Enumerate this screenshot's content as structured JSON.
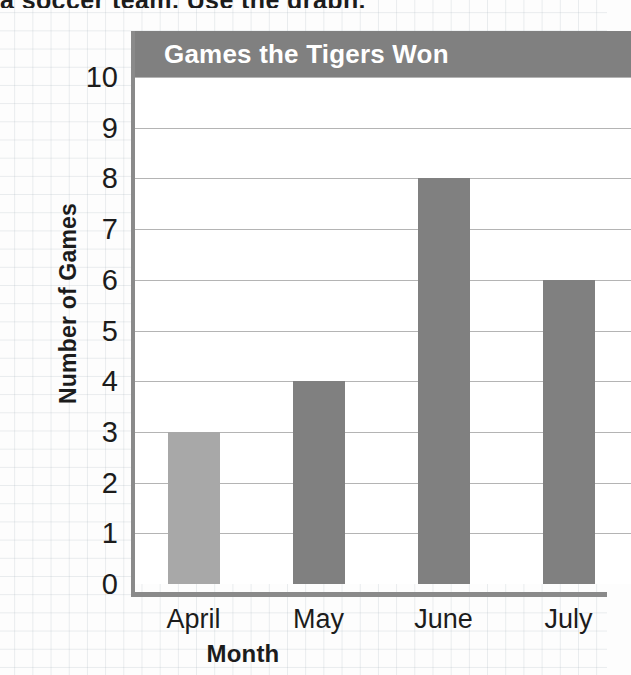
{
  "page": {
    "top_cut_text": "a soccer team. Use the graph."
  },
  "chart_data": {
    "type": "bar",
    "title": "Games the Tigers Won",
    "xlabel": "Month",
    "ylabel": "Number of Games",
    "categories": [
      "April",
      "May",
      "June",
      "July"
    ],
    "values": [
      3,
      4,
      8,
      6
    ],
    "ylim": [
      0,
      10
    ],
    "yticks": [
      "10",
      "9",
      "8",
      "7",
      "6",
      "5",
      "4",
      "3",
      "2",
      "1",
      "0"
    ],
    "ytick_values": [
      10,
      9,
      8,
      7,
      6,
      5,
      4,
      3,
      2,
      1,
      0
    ],
    "grid": true,
    "legend": false,
    "bar_colors": [
      "#a8a8a8",
      "#808080",
      "#808080",
      "#808080"
    ],
    "colors": {
      "banner": "#808080",
      "banner_text": "#ffffff",
      "gridline": "#b4b4b4",
      "axis": "#8a8a8a",
      "plot_background": "#ffffff",
      "text": "#1c1c1c"
    }
  }
}
